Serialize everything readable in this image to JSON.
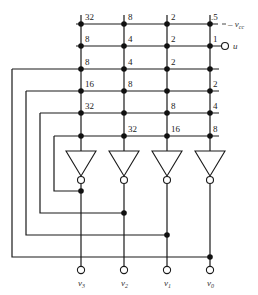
{
  "diagram": {
    "type": "Hopfield-style A/D converter resistive crossbar with inverting amplifiers",
    "columns_x": [
      81,
      124,
      167,
      210
    ],
    "rows_y": [
      24,
      46,
      69,
      91,
      113,
      136
    ],
    "row_labels": [
      "-v_cc",
      "u",
      "",
      "",
      "",
      ""
    ],
    "weights": [
      [
        "32",
        "8",
        "2",
        ".5"
      ],
      [
        "8",
        "4",
        "2",
        "1"
      ],
      [
        "8",
        "4",
        "2",
        ""
      ],
      [
        "16",
        "8",
        "",
        "2"
      ],
      [
        "32",
        "",
        "8",
        "4"
      ],
      [
        "",
        "32",
        "16",
        "8"
      ]
    ],
    "inputs": {
      "vcc_label": "– v",
      "vcc_sub": "cc",
      "u_label": "u"
    },
    "outputs": [
      {
        "label": "v",
        "sub": "3"
      },
      {
        "label": "v",
        "sub": "2"
      },
      {
        "label": "v",
        "sub": "1"
      },
      {
        "label": "v",
        "sub": "0"
      }
    ],
    "amplifier_count": 4,
    "colors": {
      "line": "#1a1a1a",
      "background": "#ffffff"
    }
  }
}
